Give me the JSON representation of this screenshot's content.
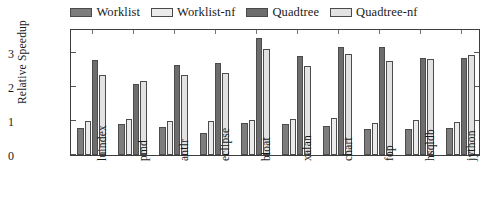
{
  "chart_data": {
    "type": "bar",
    "title": "",
    "xlabel": "",
    "ylabel": "Relative Speedup",
    "ylim": [
      0,
      3.75
    ],
    "yticks": [
      0,
      1,
      2,
      3
    ],
    "ytick_labels": [
      "0",
      "1",
      "2",
      "3"
    ],
    "grid": false,
    "legend_position": "top-center",
    "categories": [
      "luindex",
      "pmd",
      "antlr",
      "eclipse",
      "bloat",
      "xalan",
      "chart",
      "fop",
      "hsqldb",
      "jython"
    ],
    "series": [
      {
        "name": "Worklist",
        "color": "#7d7d7d",
        "values": [
          0.8,
          0.92,
          0.83,
          0.66,
          0.95,
          0.93,
          0.86,
          0.76,
          0.76,
          0.8
        ]
      },
      {
        "name": "Worklist-nf",
        "color": "#ebebeb",
        "values": [
          1.0,
          1.06,
          0.99,
          0.99,
          1.03,
          1.06,
          1.08,
          0.95,
          1.04,
          0.97
        ]
      },
      {
        "name": "Quadtree",
        "color": "#6d6d6d",
        "values": [
          2.82,
          2.1,
          2.66,
          2.73,
          3.45,
          2.93,
          3.2,
          3.18,
          2.87,
          2.86
        ]
      },
      {
        "name": "Quadtree-nf",
        "color": "#e2e2e2",
        "values": [
          2.37,
          2.18,
          2.35,
          2.43,
          3.13,
          2.63,
          2.98,
          2.77,
          2.83,
          2.96
        ]
      }
    ]
  },
  "legend": {
    "entries": [
      {
        "label": "Worklist",
        "swatch": "#7d7d7d"
      },
      {
        "label": "Worklist-nf",
        "swatch": "#ebebeb"
      },
      {
        "label": "Quadtree",
        "swatch": "#6d6d6d"
      },
      {
        "label": "Quadtree-nf",
        "swatch": "#e2e2e2"
      }
    ]
  },
  "axes": {
    "y_title": "Relative Speedup",
    "y_tick_labels": [
      "0",
      "1",
      "2",
      "3"
    ],
    "x_tick_labels": [
      "luindex",
      "pmd",
      "antlr",
      "eclipse",
      "bloat",
      "xalan",
      "chart",
      "fop",
      "hsqldb",
      "jython"
    ]
  },
  "colors": {
    "frame": "#3d3d3d",
    "text": "#1a1a1a",
    "background": "#ffffff"
  }
}
